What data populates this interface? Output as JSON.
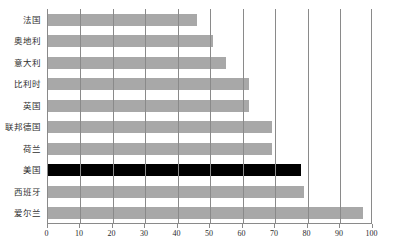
{
  "chart": {
    "title": "",
    "axis": {
      "xlabel": "",
      "ylabel": ""
    }
  },
  "chart_data": {
    "type": "bar",
    "orientation": "horizontal",
    "title": "",
    "xlabel": "",
    "ylabel": "",
    "xlim": [
      0,
      100
    ],
    "ylim": null,
    "grid": true,
    "legend": null,
    "xticks": [
      0,
      10,
      20,
      30,
      40,
      50,
      60,
      70,
      80,
      90,
      100
    ],
    "xtick_labels": [
      "0",
      "10",
      "20",
      "30",
      "40",
      "50",
      "60",
      "70",
      "80",
      "90",
      "100"
    ],
    "categories": [
      "法国",
      "奥地利",
      "意大利",
      "比利时",
      "英国",
      "联邦德国",
      "荷兰",
      "美国",
      "西班牙",
      "爱尔兰"
    ],
    "values": [
      46,
      51,
      55,
      62,
      62,
      69,
      69,
      78,
      79,
      97
    ],
    "highlight_category": "美国",
    "colors": {
      "bar": "#a8a8a8",
      "highlight_bar": "#000000",
      "grid": "#8a8a8a",
      "axis": "#8a8a8a",
      "text": "#2b2b2b",
      "background": "#ffffff"
    }
  }
}
